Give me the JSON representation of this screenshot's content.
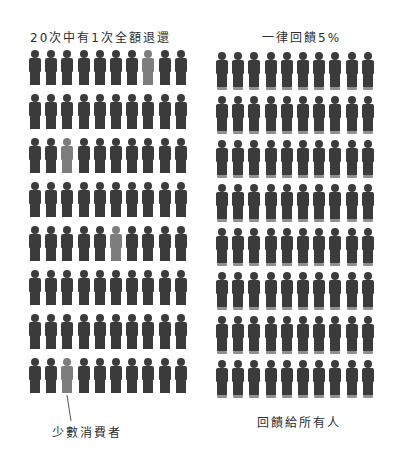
{
  "left_panel": {
    "title": "20次中有1次全額退還",
    "rows": 8,
    "cols": 10,
    "highlighted": [
      [
        0,
        7
      ],
      [
        2,
        2
      ],
      [
        4,
        5
      ],
      [
        7,
        2
      ]
    ],
    "figure_color": "#3b3b3b",
    "highlight_color": "#7d7d7d",
    "annotation": "少數消費者"
  },
  "right_panel": {
    "title": "一律回饋5%",
    "rows": 8,
    "cols": 10,
    "figure_color": "#3b3b3b",
    "base_color": "#8f8f8f",
    "annotation": "回饋給所有人"
  }
}
